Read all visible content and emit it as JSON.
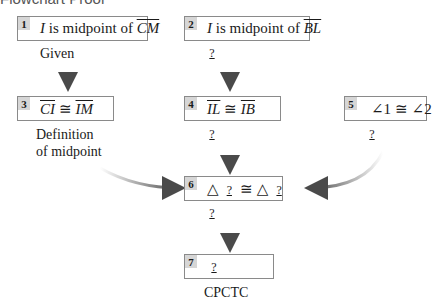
{
  "title_cut": "Flowchart Proof",
  "steps": [
    {
      "num": "1",
      "statement_pre": "I",
      "statement_mid": " is midpoint of ",
      "statement_seg": "CM",
      "reason": "Given"
    },
    {
      "num": "2",
      "statement_pre": "I",
      "statement_mid": " is midpoint of ",
      "statement_seg": "BL",
      "reason": "?"
    },
    {
      "num": "3",
      "seg_a": "CI",
      "cong": " ≅ ",
      "seg_b": "IM",
      "reason_line1": "Definition",
      "reason_line2": "of midpoint"
    },
    {
      "num": "4",
      "seg_a": "IL",
      "cong": " ≅ ",
      "seg_b": "IB",
      "reason": "?"
    },
    {
      "num": "5",
      "statement": "∠1 ≅ ∠2",
      "reason": "?"
    },
    {
      "num": "6",
      "tri": "△",
      "blank_a": "?",
      "cong": "≅",
      "blank_b": "?",
      "reason": "?"
    },
    {
      "num": "7",
      "blank": "?",
      "reason": "CPCTC"
    }
  ],
  "colors": {
    "box_border": "#8a8a8a",
    "num_bg": "#d6d6d6",
    "arrow": "#555555"
  }
}
